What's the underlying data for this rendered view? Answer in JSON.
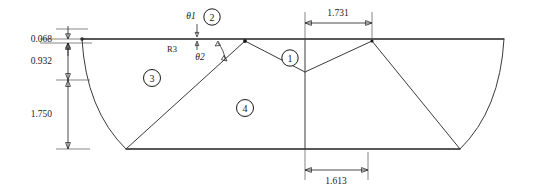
{
  "drawing": {
    "title": "Airfoil / blade cross-section panel layout",
    "type": "2d-technical-drawing",
    "units": "inches (implied)",
    "line_color": "#3a3a3a",
    "highlight_color": "#777777",
    "text_color": "#1a1a1a",
    "background": "#ffffff"
  },
  "dimensions": {
    "left_stack": [
      {
        "name": "thickness-top",
        "value": "0.068",
        "orientation": "vertical"
      },
      {
        "name": "upper-height",
        "value": "0.932",
        "orientation": "vertical"
      },
      {
        "name": "lower-height",
        "value": "1.750",
        "orientation": "vertical"
      }
    ],
    "top": {
      "name": "top-span",
      "value": "1.731",
      "orientation": "horizontal"
    },
    "bottom": {
      "name": "bottom-span",
      "value": "1.613",
      "orientation": "horizontal"
    }
  },
  "annotations": {
    "radius": {
      "label": "R3",
      "name": "radius-callout"
    },
    "angles": [
      {
        "label": "θ1",
        "name": "theta-1"
      },
      {
        "label": "θ2",
        "name": "theta-2"
      }
    ]
  },
  "balloons": [
    {
      "id": "1",
      "label": "1",
      "name": "region-balloon-1"
    },
    {
      "id": "2",
      "label": "2",
      "name": "region-balloon-2"
    },
    {
      "id": "3",
      "label": "3",
      "name": "region-balloon-3"
    },
    {
      "id": "4",
      "label": "4",
      "name": "region-balloon-4"
    }
  ]
}
